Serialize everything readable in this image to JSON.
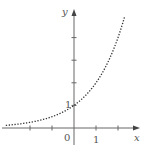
{
  "chart_data": {
    "type": "line",
    "title": "",
    "function": "y = 2^x",
    "xlabel": "x",
    "ylabel": "y",
    "x_tick_labels": [
      "0",
      "1"
    ],
    "y_tick_labels": [
      "1"
    ],
    "x_ticks": [
      -2,
      -1,
      1,
      2
    ],
    "y_ticks": [
      1,
      2,
      3,
      4
    ],
    "xlim": [
      -3.2,
      3
    ],
    "ylim": [
      0,
      5.2
    ],
    "line_style": "dotted",
    "grid": false,
    "x": [
      -3.1,
      -3,
      -2.5,
      -2,
      -1.5,
      -1,
      -0.5,
      0,
      0.5,
      1,
      1.5,
      2,
      2.3
    ],
    "values": [
      0.117,
      0.125,
      0.177,
      0.25,
      0.354,
      0.5,
      0.707,
      1,
      1.414,
      2,
      2.828,
      4,
      4.925
    ]
  },
  "labels": {
    "origin": "0",
    "x_one": "1",
    "y_one": "1",
    "x_axis": "x",
    "y_axis": "y"
  }
}
